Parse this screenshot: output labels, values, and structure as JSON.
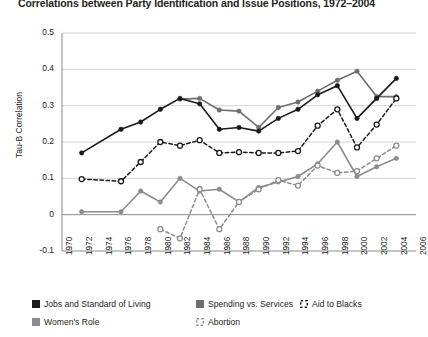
{
  "chart_data": {
    "type": "line",
    "title": "Correlations between Party Identification and Issue Positions, 1972–2004",
    "xlabel": "",
    "ylabel": "Tau-B Correlation",
    "ylim": [
      -0.1,
      0.5
    ],
    "ytick_labels": [
      "0.5",
      "0.4",
      "0.3",
      "0.2",
      "0.1",
      "0",
      "-0.1"
    ],
    "ytick_values": [
      0.5,
      0.4,
      0.3,
      0.2,
      0.1,
      0,
      -0.1
    ],
    "xlim": [
      1970,
      2006
    ],
    "xtick_labels": [
      "1970",
      "1972",
      "1974",
      "1976",
      "1978",
      "1980",
      "1982",
      "1984",
      "1986",
      "1988",
      "1990",
      "1992",
      "1994",
      "1996",
      "1998",
      "2000",
      "2002",
      "2004",
      "2006"
    ],
    "grid": "horizontal",
    "legend_position": "below",
    "series": [
      {
        "name": "Jobs and Standard of Living",
        "color": "#1a1a1a",
        "style": "solid",
        "marker": "filled-square-circle",
        "x": [
          1972,
          1976,
          1978,
          1980,
          1982,
          1984,
          1986,
          1988,
          1990,
          1992,
          1994,
          1996,
          1998,
          2000,
          2002,
          2004
        ],
        "y": [
          0.17,
          0.235,
          0.255,
          0.29,
          0.32,
          0.305,
          0.235,
          0.24,
          0.23,
          0.265,
          0.29,
          0.33,
          0.355,
          0.265,
          0.32,
          0.375
        ]
      },
      {
        "name": "Spending vs. Services",
        "color": "#6e6e6e",
        "style": "solid",
        "marker": "filled",
        "x": [
          1982,
          1984,
          1986,
          1988,
          1990,
          1992,
          1994,
          1996,
          1998,
          2000,
          2002,
          2004
        ],
        "y": [
          0.318,
          0.32,
          0.288,
          0.285,
          0.24,
          0.295,
          0.31,
          0.34,
          0.37,
          0.395,
          0.325,
          0.325
        ]
      },
      {
        "name": "Aid to Blacks",
        "color": "#1a1a1a",
        "style": "dashed",
        "marker": "open-circle",
        "x": [
          1972,
          1976,
          1978,
          1980,
          1982,
          1984,
          1986,
          1988,
          1990,
          1992,
          1994,
          1996,
          1998,
          2000,
          2002,
          2004
        ],
        "y": [
          0.098,
          0.092,
          0.145,
          0.2,
          0.19,
          0.205,
          0.17,
          0.172,
          0.17,
          0.17,
          0.175,
          0.245,
          0.29,
          0.185,
          0.248,
          0.32
        ]
      },
      {
        "name": "Women's Role",
        "color": "#8c8c8c",
        "style": "solid",
        "marker": "filled",
        "x": [
          1972,
          1976,
          1978,
          1980,
          1982,
          1984,
          1986,
          1988,
          1990,
          1992,
          1994,
          1996,
          1998,
          2000,
          2002,
          2004
        ],
        "y": [
          0.008,
          0.008,
          0.065,
          0.035,
          0.1,
          0.065,
          0.07,
          0.035,
          0.075,
          0.09,
          0.105,
          0.14,
          0.2,
          0.105,
          0.132,
          0.155
        ]
      },
      {
        "name": "Abortion",
        "color": "#8c8c8c",
        "style": "dashed",
        "marker": "open-circle",
        "x": [
          1980,
          1982,
          1984,
          1986,
          1988,
          1990,
          1992,
          1994,
          1996,
          1998,
          2000,
          2002,
          2004
        ],
        "y": [
          -0.04,
          -0.065,
          0.07,
          -0.04,
          0.035,
          0.07,
          0.095,
          0.08,
          0.135,
          0.115,
          0.12,
          0.155,
          0.19
        ]
      }
    ]
  },
  "legend": {
    "items": [
      {
        "label": "Jobs and Standard of Living",
        "swatch": "black-square",
        "color": "#1a1a1a"
      },
      {
        "label": "Spending vs. Services",
        "swatch": "gray-square",
        "color": "#6e6e6e"
      },
      {
        "label": "Aid to Blacks",
        "swatch": "open-dashed-square",
        "color": "#1a1a1a"
      },
      {
        "label": "Women's Role",
        "swatch": "gray-square",
        "color": "#8c8c8c"
      },
      {
        "label": "Abortion",
        "swatch": "open-dashed-square",
        "color": "#8c8c8c"
      }
    ]
  }
}
